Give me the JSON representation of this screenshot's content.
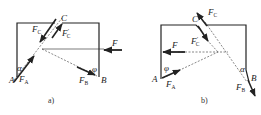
{
  "figure": {
    "panels": [
      {
        "id": "a",
        "caption": "a)",
        "points": {
          "A": "A",
          "B": "B",
          "C": "C"
        },
        "forces": {
          "F": {
            "base": "F",
            "sub": ""
          },
          "FA": {
            "base": "F",
            "sub": "A"
          },
          "FB": {
            "base": "F",
            "sub": "B"
          },
          "FC": {
            "base": "F",
            "sub": "C"
          },
          "FCp": {
            "base": "F",
            "sub": "C",
            "prime": "′"
          }
        },
        "angles": {
          "alpha": "α",
          "phi": "φ"
        }
      },
      {
        "id": "b",
        "caption": "b)",
        "points": {
          "A": "A",
          "B": "B",
          "C": "C"
        },
        "forces": {
          "F": {
            "base": "F",
            "sub": ""
          },
          "FA": {
            "base": "F",
            "sub": "A"
          },
          "FB": {
            "base": "F",
            "sub": "B"
          },
          "FC": {
            "base": "F",
            "sub": "C"
          },
          "FCp": {
            "base": "F",
            "sub": "C",
            "prime": "′"
          }
        },
        "angles": {
          "alpha": "α",
          "phi": "φ"
        }
      }
    ],
    "colors": {
      "stroke": "#222222",
      "dashed": "#555555",
      "background": "#ffffff"
    }
  }
}
